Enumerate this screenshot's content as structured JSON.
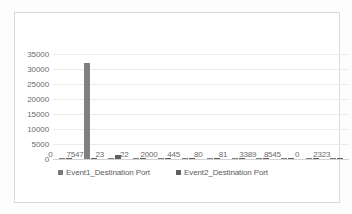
{
  "chart_data": {
    "type": "bar",
    "title": "",
    "xlabel": "",
    "ylabel": "",
    "ylim": [
      0,
      35000
    ],
    "grid": true,
    "legend_position": "bottom",
    "categories": [
      "0",
      "7547",
      "23",
      "22",
      "2000",
      "445",
      "80",
      "81",
      "3389",
      "8545",
      "0",
      "2323"
    ],
    "ytick_labels": [
      "35000",
      "30000",
      "25000",
      "20000",
      "15000",
      "10000",
      "5000",
      "0"
    ],
    "ytick_values": [
      35000,
      30000,
      25000,
      20000,
      15000,
      10000,
      5000,
      0
    ],
    "series": [
      {
        "name": "Event1_Destination Port",
        "color": "#808080",
        "values": [
          350,
          32000,
          300,
          250,
          120,
          100,
          90,
          90,
          80,
          80,
          80,
          70
        ]
      },
      {
        "name": "Event2_Destination Port",
        "color": "#5f5f5f",
        "values": [
          120,
          120,
          1500,
          400,
          150,
          90,
          90,
          90,
          80,
          80,
          80,
          70
        ]
      }
    ]
  },
  "legend": {
    "items": [
      {
        "label": "Event1_Destination Port"
      },
      {
        "label": "Event2_Destination Port"
      }
    ]
  },
  "colors": {
    "series1": "#808080",
    "series2": "#5f5f5f",
    "gridline": "#ebebeb",
    "axis": "#d2d2d2",
    "tick_text": "#6b6b6b",
    "frame": "#d9d9d9",
    "background": "#ffffff"
  }
}
